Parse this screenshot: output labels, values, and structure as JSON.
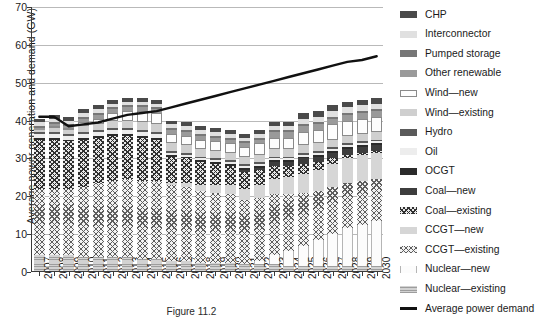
{
  "chart_data": {
    "type": "bar",
    "subtype": "stacked-bar-with-line-overlay",
    "title": "",
    "xlabel": "",
    "ylabel": "Average power generation and demand (GW)",
    "ylim": [
      0,
      70
    ],
    "ytick_step": 10,
    "yticks": [
      0,
      10,
      20,
      30,
      40,
      50,
      60,
      70
    ],
    "grid": true,
    "grid_axis": "y",
    "legend_position": "right",
    "categories": [
      "2007",
      "2008",
      "2009",
      "2010",
      "2011",
      "2012",
      "2013",
      "2014",
      "2015",
      "2016",
      "2017",
      "2018",
      "2019",
      "2020",
      "2021",
      "2022",
      "2023",
      "2024",
      "2025",
      "2026",
      "2027",
      "2028",
      "2029",
      "2030"
    ],
    "series": [
      {
        "name": "Nuclear—existing",
        "key": "nucex",
        "color": "#d2d2d2",
        "pattern": "horizontal-lines",
        "values": [
          4.5,
          4.5,
          4.5,
          4.0,
          4.0,
          4.0,
          4.0,
          3.5,
          3.5,
          3.0,
          3.0,
          2.5,
          2.5,
          2.5,
          2.0,
          2.0,
          2.0,
          1.5,
          1.5,
          1.5,
          1.5,
          1.5,
          1.5,
          1.5
        ]
      },
      {
        "name": "Nuclear—new",
        "key": "nucnew",
        "color": "#fcfcfc",
        "pattern": "solid",
        "values": [
          0,
          0,
          0,
          0,
          0,
          0,
          0,
          0,
          0,
          0,
          0,
          0,
          0,
          0,
          0,
          1.0,
          2.5,
          4.0,
          5.5,
          7.0,
          8.5,
          10.0,
          11.0,
          12.0
        ]
      },
      {
        "name": "CCGT—existing",
        "key": "ccgtex",
        "color": "#f2f2f2",
        "pattern": "fine-crosshatch",
        "values": [
          17.5,
          17.5,
          17.5,
          18.5,
          19.5,
          20.0,
          20.5,
          20.5,
          20.5,
          20.0,
          19.5,
          19.0,
          18.5,
          18.0,
          17.0,
          16.5,
          16.0,
          15.0,
          14.0,
          13.0,
          12.5,
          12.0,
          11.5,
          11.0
        ]
      },
      {
        "name": "CCGT—new",
        "key": "ccgtnew",
        "color": "#d6d6d6",
        "pattern": "solid",
        "values": [
          0,
          0,
          0,
          0,
          0,
          0,
          0,
          0,
          0,
          0.5,
          1.0,
          1.5,
          2.0,
          2.5,
          3.0,
          3.5,
          4.0,
          4.5,
          5.0,
          5.5,
          6.0,
          6.5,
          7.0,
          7.0
        ]
      },
      {
        "name": "Coal—existing",
        "key": "coalex",
        "color": "#e8e8e8",
        "pattern": "bold-crosshatch",
        "values": [
          13.0,
          13.0,
          12.5,
          12.5,
          12.0,
          12.0,
          11.5,
          11.5,
          11.0,
          7.0,
          6.5,
          6.0,
          5.5,
          5.0,
          4.5,
          4.0,
          3.5,
          3.0,
          2.5,
          2.0,
          1.5,
          1.0,
          0.5,
          0.5
        ]
      },
      {
        "name": "Coal—new",
        "key": "coalnew",
        "color": "#3d3d3d",
        "pattern": "solid",
        "values": [
          0,
          0,
          0,
          0,
          0,
          0,
          0,
          0,
          0,
          0,
          0,
          0,
          0,
          0,
          0.5,
          0.5,
          1.0,
          1.0,
          1.5,
          1.5,
          1.5,
          1.5,
          1.5,
          1.5
        ]
      },
      {
        "name": "OCGT",
        "key": "ocgt",
        "color": "#2b2b2b",
        "pattern": "solid",
        "values": [
          0.5,
          0.5,
          0.5,
          0.5,
          0.5,
          0.5,
          0.5,
          0.5,
          0.5,
          0.5,
          0.5,
          0.5,
          0.5,
          0.5,
          0.5,
          0.5,
          0.5,
          0.5,
          0.5,
          0.5,
          0.5,
          0.5,
          0.5,
          0.5
        ]
      },
      {
        "name": "Oil",
        "key": "oil",
        "color": "#ededed",
        "pattern": "solid",
        "values": [
          1.0,
          1.0,
          1.0,
          1.0,
          1.0,
          1.0,
          1.0,
          1.0,
          1.0,
          0.5,
          0.5,
          0.5,
          0.5,
          0.5,
          0.5,
          0.5,
          0.5,
          0.5,
          0.5,
          0.5,
          0.5,
          0.5,
          0.5,
          0.5
        ]
      },
      {
        "name": "Hydro",
        "key": "hydro",
        "color": "#5a5a5a",
        "pattern": "solid",
        "values": [
          0.5,
          0.5,
          0.5,
          0.5,
          0.5,
          0.5,
          0.5,
          0.5,
          0.5,
          0.5,
          0.5,
          0.5,
          0.5,
          0.5,
          0.5,
          0.5,
          0.5,
          0.5,
          0.5,
          0.5,
          0.5,
          0.5,
          0.5,
          0.5
        ]
      },
      {
        "name": "Wind—existing",
        "key": "windex",
        "color": "#cfcfcf",
        "pattern": "solid",
        "values": [
          0.5,
          1.0,
          1.0,
          1.5,
          1.5,
          2.0,
          2.0,
          2.0,
          2.0,
          2.0,
          2.0,
          2.0,
          2.0,
          2.0,
          2.0,
          2.0,
          2.0,
          2.0,
          2.0,
          2.0,
          2.0,
          2.0,
          2.0,
          2.0
        ]
      },
      {
        "name": "Wind—new",
        "key": "windnew",
        "color": "#fdfdfd",
        "pattern": "outline",
        "values": [
          0,
          0.5,
          0.5,
          1.0,
          1.5,
          2.0,
          2.5,
          3.0,
          3.0,
          2.5,
          2.5,
          2.5,
          2.5,
          2.5,
          2.5,
          3.0,
          3.0,
          3.0,
          3.5,
          3.5,
          4.0,
          4.0,
          4.0,
          4.0
        ]
      },
      {
        "name": "Other renewable",
        "key": "other",
        "color": "#9a9a9a",
        "pattern": "solid",
        "values": [
          0.5,
          0.5,
          0.5,
          1.0,
          1.0,
          1.0,
          1.0,
          1.0,
          1.0,
          1.0,
          1.0,
          1.0,
          1.0,
          1.0,
          1.0,
          1.0,
          1.5,
          1.5,
          1.5,
          1.5,
          1.5,
          1.5,
          1.5,
          1.5
        ]
      },
      {
        "name": "Pumped storage",
        "key": "pumped",
        "color": "#777777",
        "pattern": "solid",
        "values": [
          0.5,
          0.5,
          0.5,
          0.5,
          0.5,
          0.5,
          0.5,
          0.5,
          0.5,
          0.5,
          0.5,
          0.5,
          0.5,
          0.5,
          0.5,
          0.5,
          0.5,
          0.5,
          0.5,
          0.5,
          0.5,
          0.5,
          0.5,
          0.5
        ]
      },
      {
        "name": "Interconnector",
        "key": "inter",
        "color": "#e0e0e0",
        "pattern": "solid",
        "values": [
          1.0,
          1.0,
          1.0,
          1.0,
          1.0,
          1.0,
          1.0,
          1.0,
          1.0,
          1.0,
          1.0,
          1.0,
          1.0,
          1.0,
          1.0,
          1.0,
          1.0,
          1.0,
          1.5,
          1.5,
          1.5,
          1.5,
          1.5,
          1.5
        ]
      },
      {
        "name": "CHP",
        "key": "chp",
        "color": "#4a4a4a",
        "pattern": "solid",
        "values": [
          1.0,
          1.0,
          1.0,
          1.0,
          1.0,
          1.0,
          1.0,
          1.0,
          1.0,
          1.0,
          1.0,
          1.0,
          1.0,
          1.0,
          1.0,
          1.0,
          1.0,
          1.0,
          1.5,
          1.5,
          1.5,
          1.5,
          1.5,
          1.5
        ]
      }
    ],
    "overlay_line": {
      "name": "Average power demand",
      "color": "#111111",
      "values": [
        41.0,
        41.0,
        38.5,
        39.0,
        39.5,
        40.5,
        41.5,
        42.0,
        42.5,
        43.5,
        44.5,
        45.5,
        46.5,
        47.5,
        48.5,
        49.5,
        50.5,
        51.5,
        52.5,
        53.5,
        54.5,
        55.5,
        56.0,
        57.0
      ]
    }
  },
  "legend": {
    "items": [
      {
        "label": "CHP",
        "key": "chp",
        "type": "swatch"
      },
      {
        "label": "Interconnector",
        "key": "inter",
        "type": "swatch"
      },
      {
        "label": "Pumped storage",
        "key": "pumped",
        "type": "swatch"
      },
      {
        "label": "Other renewable",
        "key": "other",
        "type": "swatch"
      },
      {
        "label": "Wind—new",
        "key": "windnew",
        "type": "swatch"
      },
      {
        "label": "Wind—existing",
        "key": "windex",
        "type": "swatch"
      },
      {
        "label": "Hydro",
        "key": "hydro",
        "type": "swatch"
      },
      {
        "label": "Oil",
        "key": "oil",
        "type": "swatch"
      },
      {
        "label": "OCGT",
        "key": "ocgt",
        "type": "swatch"
      },
      {
        "label": "Coal—new",
        "key": "coalnew",
        "type": "swatch"
      },
      {
        "label": "Coal—existing",
        "key": "coalex",
        "type": "swatch"
      },
      {
        "label": "CCGT—new",
        "key": "ccgtnew",
        "type": "swatch"
      },
      {
        "label": "CCGT—existing",
        "key": "ccgtex",
        "type": "swatch"
      },
      {
        "label": "Nuclear—new",
        "key": "nucnew",
        "type": "swatch"
      },
      {
        "label": "Nuclear—existing",
        "key": "nucex",
        "type": "swatch"
      },
      {
        "label": "Average power demand",
        "key": "line",
        "type": "line"
      }
    ]
  },
  "caption": "Figure 11.2"
}
